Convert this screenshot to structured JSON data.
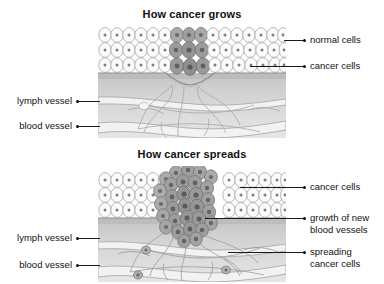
{
  "diagram": {
    "title_top": "How cancer grows",
    "title_bottom": "How cancer spreads"
  },
  "panel_grows": {
    "title": "How cancer grows",
    "labels_right": [
      {
        "name": "normal-cells",
        "text": "normal cells"
      },
      {
        "name": "cancer-cells",
        "text": "cancer cells"
      }
    ],
    "labels_left": [
      {
        "name": "lymph-vessel",
        "text": "lymph vessel"
      },
      {
        "name": "blood-vessel",
        "text": "blood vessel"
      }
    ]
  },
  "panel_spreads": {
    "title": "How cancer spreads",
    "labels_right": [
      {
        "name": "cancer-cells",
        "text": "cancer cells"
      },
      {
        "name": "growth-new-blood-vessels-line1",
        "text": "growth of new"
      },
      {
        "name": "growth-new-blood-vessels-line2",
        "text": "blood vessels"
      },
      {
        "name": "spreading-cancer-cells-line1",
        "text": "spreading"
      },
      {
        "name": "spreading-cancer-cells-line2",
        "text": "cancer cells"
      }
    ],
    "labels_left": [
      {
        "name": "lymph-vessel",
        "text": "lymph vessel"
      },
      {
        "name": "blood-vessel",
        "text": "blood vessel"
      }
    ]
  },
  "colors": {
    "background": "#ffffff",
    "text": "#111111",
    "leader_line": "#1a1a1a",
    "normal_cell_fill": "#fbfbfb",
    "normal_cell_stroke": "#9a9a9a",
    "nucleus": "#7d7d7d",
    "cancer_cell_fill": "#a9a9a9",
    "cancer_cell_stroke": "#6e6e6e",
    "cancer_nucleus": "#6a6a6a",
    "tissue_upper": "#c9c9c9",
    "tissue_lower": "#dedede",
    "vessel_fill": "#f2f2f2",
    "vessel_stroke": "#9e9e9e",
    "basement_membrane": "#8f8f8f"
  }
}
